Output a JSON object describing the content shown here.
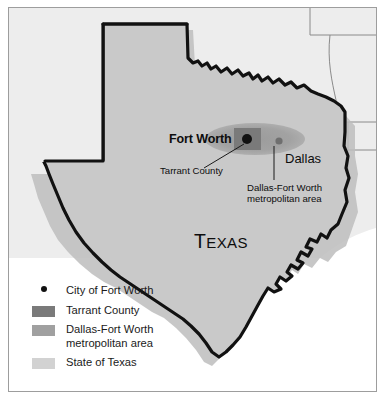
{
  "figure": {
    "title_label": "Texas",
    "map_labels": {
      "fort_worth": "Fort Worth",
      "dallas": "Dallas",
      "state": "Texas",
      "state_cap_first": "T",
      "state_cap_rest": "EXAS",
      "tarrant_county_annotation": "Tarrant County",
      "dfw_metro_annotation_line1": "Dallas-Fort Worth",
      "dfw_metro_annotation_line2": "metropolitan area"
    }
  },
  "legend": {
    "items": [
      {
        "label": "City of Fort Worth",
        "key": "dot",
        "color": "#111111"
      },
      {
        "label": "Tarrant County",
        "key": "swatch",
        "color": "#7a7a7a"
      },
      {
        "label": "Dallas-Fort Worth\nmetropolitan area",
        "key": "swatch",
        "color": "#a0a0a0"
      },
      {
        "label": "State of Texas",
        "key": "swatch",
        "color": "#d2d2d2"
      }
    ]
  },
  "colors": {
    "state_fill": "#c9c9c9",
    "neighbor_fill": "#ededed",
    "metro_fill": "#a0a0a0",
    "county_fill": "#7a7a7a",
    "city_dot": "#111111",
    "dallas_dot": "#6f6f6f",
    "outline": "#111111",
    "neighbor_border": "#8a8a8a",
    "shadow": "#bdbdbd",
    "frame": "#9d9d9d",
    "background": "#ffffff",
    "ocean": "#ffffff"
  },
  "map_geometry": {
    "projection_note": "stylized state outline",
    "state": "Texas",
    "features": [
      "panhandle",
      "red-river-northern-border",
      "rio-grande-southwestern-border",
      "gulf-coast",
      "southern-tip"
    ]
  }
}
